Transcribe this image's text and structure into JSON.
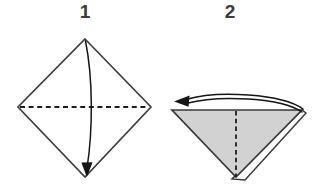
{
  "figure": {
    "background_color": "#ffffff",
    "width": 318,
    "height": 186
  },
  "palette": {
    "paper_front": "#ffffff",
    "paper_back": "#d2d2d2",
    "line_color": "#403f3f",
    "fold_line_color": "#1d1d1d",
    "arrow_color": "#151515",
    "number_color": "#3b3b3b"
  },
  "steps": [
    {
      "number": "1",
      "number_x": 85,
      "number_y": 13,
      "shape_name": "square-diamond",
      "description": "Square sheet oriented as a diamond, white side up, with a horizontal dashed valley fold line across the middle; fold the top corner down to the bottom corner.",
      "fill": "#ffffff",
      "outline_points": "85,39 151,107 85,177 18,107",
      "fold_line": {
        "type": "dashed",
        "orientation": "horizontal",
        "x1": 20,
        "y1": 107,
        "x2": 149,
        "y2": 107,
        "dash_pattern": "5,3.6"
      },
      "arrow": {
        "name": "fold-down-arrow",
        "direction": "down",
        "path": "M 85.5 41 C 93 78 93 130 87 168",
        "head_points": "86.8,177 81.4,162.6 92.6,162.2"
      }
    },
    {
      "number": "2",
      "number_x": 230,
      "number_y": 13,
      "shape_name": "folded-triangle",
      "description": "Resulting downward-pointing triangle with the colored side showing, a dashed vertical center fold line, a second layer peeking along the right edge; flip or fold the flap to the left.",
      "fill": "#d2d2d2",
      "outline_points": "172,110 302,110 236,177",
      "back_layer_points": "306,113 245,180 232,179 302,110",
      "fold_line": {
        "type": "dashed",
        "orientation": "vertical",
        "x1": 236,
        "y1": 111,
        "x2": 236,
        "y2": 177,
        "dash_pattern": "4.4,3.4"
      },
      "arrow": {
        "name": "fold-left-arrow",
        "direction": "left",
        "path_outer": "M 303 109 C 282 94 218 90 186 99.5",
        "path_inner": "M 302 112 C 281 98 220 94.5 187 103.2",
        "head_points": "174,101.5 189.5,95.6 188.6,106.8"
      }
    }
  ]
}
